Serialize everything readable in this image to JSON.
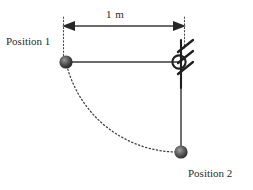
{
  "figure": {
    "type": "physics-pendulum-diagram",
    "background_color": "#ffffff",
    "width": 253,
    "height": 190,
    "line_color": "#3a3a3a",
    "text_color": "#2b2b2b",
    "ball_color_dark": "#2e2e2e",
    "ball_color_light": "#8f8f8f"
  },
  "labels": {
    "position_1": "Position 1",
    "position_2": "Position 2",
    "dimension": "1 m"
  },
  "geometry": {
    "pivot": {
      "x": 181,
      "y": 62,
      "radius": 6.5
    },
    "ball_position_1": {
      "x": 66,
      "y": 62,
      "radius": 6.5
    },
    "ball_position_2": {
      "x": 181,
      "y": 152,
      "radius": 6.5
    },
    "rod_horizontal": {
      "x1": 66,
      "y1": 62,
      "x2": 181,
      "y2": 62
    },
    "rod_vertical": {
      "x1": 181,
      "y1": 62,
      "x2": 181,
      "y2": 152
    },
    "dimension_line": {
      "x1": 63,
      "y1": 26,
      "x2": 185,
      "y2": 26
    },
    "arc": {
      "center_x": 181,
      "center_y": 62,
      "radius": 115,
      "from_deg": 180,
      "to_deg": 90
    }
  },
  "icons": {
    "pivot": "fixed-pivot-support-icon",
    "ball_1": "pendulum-bob-icon",
    "ball_2": "pendulum-bob-icon",
    "arrow_left": "arrow-left-icon",
    "arrow_right": "arrow-right-icon",
    "arc": "dotted-trajectory-arc-icon"
  }
}
